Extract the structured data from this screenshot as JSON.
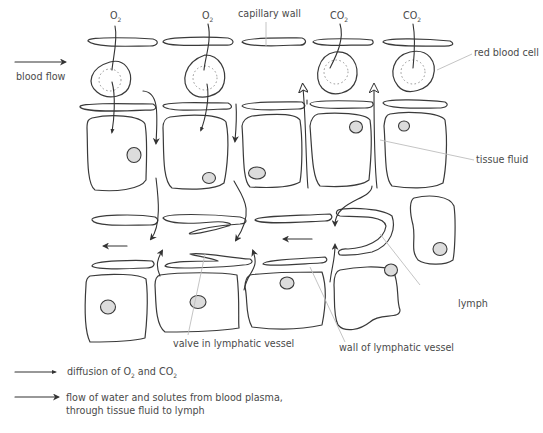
{
  "labels": {
    "o2_1": "O",
    "o2_2": "O",
    "co2_1": "CO",
    "co2_2": "CO",
    "sub2": "2",
    "capillary_wall": "capillary wall",
    "red_blood_cell": "red blood cell",
    "blood_flow": "blood flow",
    "tissue_fluid": "tissue fluid",
    "lymph": "lymph",
    "valve": "valve in lymphatic vessel",
    "lymph_wall": "wall of lymphatic vessel"
  },
  "legend": [
    {
      "arrow": "small-head",
      "text_a": "diffusion of O",
      "sub_a": "2",
      "text_b": " and CO",
      "sub_b": "2"
    },
    {
      "arrow": "large-head",
      "line1": "flow of water and solutes from blood plasma,",
      "line2": "through tissue fluid to lymph"
    }
  ],
  "colors": {
    "stroke": "#3a3a3a",
    "nucleus": "#dcdcdc",
    "leader": "#bdbdbd",
    "text": "#4a4a4a"
  }
}
